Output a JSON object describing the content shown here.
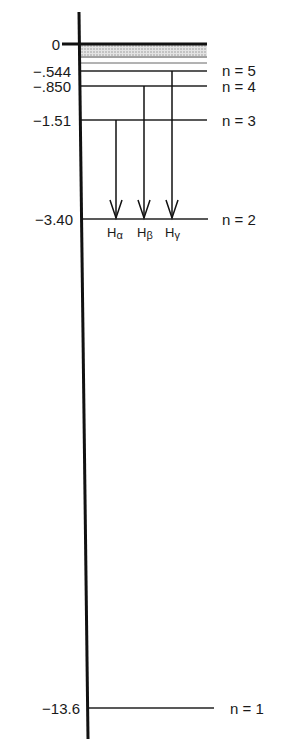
{
  "diagram": {
    "title": "",
    "axis": {
      "label": ""
    },
    "levels": [
      {
        "n": "n = 5",
        "energy": "−.544"
      },
      {
        "n": "n = 4",
        "energy": "−.850"
      },
      {
        "n": "n = 3",
        "energy": "−1.51"
      },
      {
        "n": "n = 2",
        "energy": "−3.40"
      },
      {
        "n": "n = 1",
        "energy": "−13.6"
      }
    ],
    "zero_label": "0",
    "transitions": [
      {
        "label": "H",
        "sub": "α",
        "from": "n = 3",
        "to": "n = 2"
      },
      {
        "label": "H",
        "sub": "β",
        "from": "n = 4",
        "to": "n = 2"
      },
      {
        "label": "H",
        "sub": "γ",
        "from": "n = 5",
        "to": "n = 2"
      }
    ],
    "continuum": "shaded band between 0 and upper levels"
  }
}
